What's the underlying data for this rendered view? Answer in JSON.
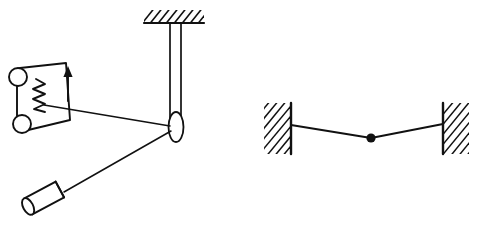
{
  "figure": {
    "background_color": "#ffffff",
    "ink_color": "#111111",
    "width": 489,
    "height": 239,
    "panels": [
      {
        "id": "left-panel",
        "name": "spring-scale-pulley-block-system",
        "caption": "",
        "elements": [
          {
            "name": "ceiling-support",
            "type": "hatched-surface",
            "label": "",
            "hatch_angle_deg": 45,
            "x": 144,
            "y": 10,
            "width": 60,
            "height": 13
          },
          {
            "name": "vertical-rod",
            "type": "double-line-rod",
            "label": "",
            "x_left": 170,
            "x_right": 181,
            "y_top": 23,
            "y_bottom": 127
          },
          {
            "name": "pulley",
            "type": "ellipse",
            "label": "",
            "cx": 176,
            "cy": 127,
            "rx": 7.5,
            "ry": 15
          },
          {
            "name": "spring-scale-body",
            "type": "slanted-plate",
            "label": "",
            "cx": 43,
            "cy": 100
          },
          {
            "name": "spring-coil",
            "type": "zigzag",
            "label": "",
            "coils": 6,
            "x": 38,
            "y_top": 79,
            "y_bottom": 110
          },
          {
            "name": "direction-arrow",
            "type": "arrow-up",
            "label": "",
            "x": 68,
            "y_tail": 100,
            "y_head": 70
          },
          {
            "name": "upper-roller",
            "type": "circle",
            "label": "",
            "cx": 18,
            "cy": 77,
            "r": 9
          },
          {
            "name": "lower-roller",
            "type": "circle",
            "label": "",
            "cx": 22,
            "cy": 124,
            "r": 9
          },
          {
            "name": "string-scale-to-pulley",
            "type": "line",
            "label": "",
            "x1": 45,
            "y1": 106,
            "x2": 169,
            "y2": 126
          },
          {
            "name": "string-pulley-to-block",
            "type": "line",
            "label": "",
            "x1": 170,
            "y1": 131,
            "x2": 64,
            "y2": 192
          },
          {
            "name": "cylindrical-block",
            "type": "cylinder",
            "label": "",
            "cx": 44,
            "cy": 198,
            "length": 40,
            "radius": 9,
            "angle_deg": -28
          }
        ]
      },
      {
        "id": "right-panel",
        "name": "wire-between-walls-with-point-mass",
        "caption": "",
        "elements": [
          {
            "name": "left-wall",
            "type": "hatched-wall",
            "label": "",
            "hatch_angle_deg": 45,
            "x": 264,
            "y": 103,
            "width": 26,
            "height": 51,
            "face": "right"
          },
          {
            "name": "right-wall",
            "type": "hatched-wall",
            "label": "",
            "hatch_angle_deg": 45,
            "x": 443,
            "y": 103,
            "width": 26,
            "height": 51,
            "face": "left"
          },
          {
            "name": "left-anchor",
            "type": "anchor-point",
            "label": "",
            "x": 291,
            "y": 125
          },
          {
            "name": "right-anchor",
            "type": "anchor-point",
            "label": "",
            "x": 443,
            "y": 124
          },
          {
            "name": "wire-left-segment",
            "type": "line",
            "label": "",
            "x1": 291,
            "y1": 125,
            "x2": 371,
            "y2": 138
          },
          {
            "name": "wire-right-segment",
            "type": "line",
            "label": "",
            "x1": 371,
            "y1": 138,
            "x2": 443,
            "y2": 124
          },
          {
            "name": "point-mass",
            "type": "filled-dot",
            "label": "",
            "cx": 371,
            "cy": 138,
            "r": 4.5
          }
        ]
      }
    ]
  }
}
